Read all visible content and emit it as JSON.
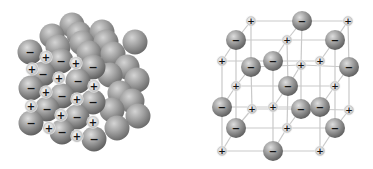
{
  "figure": {
    "panels": [
      {
        "id": "space-filling",
        "label": "Space-filling model"
      },
      {
        "id": "ball-and-stick",
        "label": "Ball-and-stick lattice model"
      }
    ]
  },
  "symbols": {
    "anion": "−",
    "cation": "+"
  },
  "colors": {
    "background": "#ffffff",
    "anion_highlight": "#d8d8d8",
    "anion_mid": "#9a9a9a",
    "anion_edge": "#5e5e5e",
    "cation_fill": "#e4e4e4",
    "cation_edge": "#b8b8b8",
    "lattice_line": "#c9c9c9",
    "sign": "#111111"
  },
  "space_filling": {
    "anion_radius": 12.5,
    "cation_radius": 5.5,
    "back_spheres": [
      [
        72,
        25
      ],
      [
        52,
        36
      ],
      [
        79,
        34
      ],
      [
        102,
        32
      ],
      [
        58,
        47
      ],
      [
        82,
        43
      ],
      [
        106,
        42
      ],
      [
        135,
        42
      ],
      [
        89,
        53
      ],
      [
        113,
        54
      ],
      [
        127,
        67
      ],
      [
        110,
        75
      ],
      [
        137,
        80
      ],
      [
        120,
        93
      ],
      [
        132,
        101
      ],
      [
        112,
        110
      ],
      [
        138,
        116
      ],
      [
        117,
        128
      ]
    ],
    "anions": [
      [
        30,
        52
      ],
      [
        61,
        61
      ],
      [
        93,
        67
      ],
      [
        43,
        74
      ],
      [
        78,
        81
      ],
      [
        31,
        88
      ],
      [
        62,
        96
      ],
      [
        93,
        102
      ],
      [
        47,
        109
      ],
      [
        77,
        117
      ],
      [
        31,
        123
      ],
      [
        62,
        132
      ],
      [
        94,
        139
      ]
    ],
    "cations": [
      [
        46,
        57
      ],
      [
        76,
        63
      ],
      [
        32,
        69
      ],
      [
        59,
        78
      ],
      [
        94,
        86
      ],
      [
        46,
        92
      ],
      [
        77,
        99
      ],
      [
        31,
        106
      ],
      [
        61,
        115
      ],
      [
        93,
        122
      ],
      [
        49,
        128
      ],
      [
        77,
        136
      ]
    ]
  },
  "lattice": {
    "anion_radius": 10,
    "cation_radius": 4.3,
    "ions": [
      {
        "x": 251,
        "y": 21,
        "type": "cation"
      },
      {
        "x": 302,
        "y": 21,
        "type": "anion"
      },
      {
        "x": 348,
        "y": 21,
        "type": "cation"
      },
      {
        "x": 251,
        "y": 67,
        "type": "anion"
      },
      {
        "x": 301,
        "y": 65,
        "type": "cation"
      },
      {
        "x": 349,
        "y": 67,
        "type": "anion"
      },
      {
        "x": 252,
        "y": 109,
        "type": "cation"
      },
      {
        "x": 301,
        "y": 109,
        "type": "anion"
      },
      {
        "x": 349,
        "y": 110,
        "type": "cation"
      },
      {
        "x": 236,
        "y": 40,
        "type": "anion"
      },
      {
        "x": 287,
        "y": 40,
        "type": "cation"
      },
      {
        "x": 335,
        "y": 40,
        "type": "anion"
      },
      {
        "x": 236,
        "y": 86,
        "type": "cation"
      },
      {
        "x": 288,
        "y": 86,
        "type": "anion"
      },
      {
        "x": 335,
        "y": 86,
        "type": "cation"
      },
      {
        "x": 236,
        "y": 128,
        "type": "anion"
      },
      {
        "x": 287,
        "y": 128,
        "type": "cation"
      },
      {
        "x": 335,
        "y": 128,
        "type": "anion"
      },
      {
        "x": 222,
        "y": 61,
        "type": "cation"
      },
      {
        "x": 273,
        "y": 61,
        "type": "anion"
      },
      {
        "x": 320,
        "y": 61,
        "type": "cation"
      },
      {
        "x": 222,
        "y": 107,
        "type": "anion"
      },
      {
        "x": 273,
        "y": 107,
        "type": "cation"
      },
      {
        "x": 320,
        "y": 107,
        "type": "anion"
      },
      {
        "x": 222,
        "y": 151,
        "type": "cation"
      },
      {
        "x": 273,
        "y": 151,
        "type": "anion"
      },
      {
        "x": 320,
        "y": 151,
        "type": "cation"
      }
    ]
  }
}
